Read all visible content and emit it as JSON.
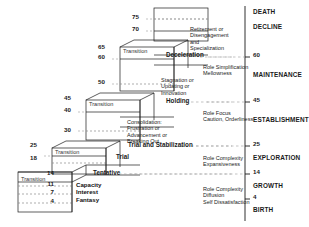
{
  "figure": {
    "ink_color": "#1a1a1a",
    "background_color": "#ffffff"
  },
  "left_ages": [
    {
      "value": "75",
      "x": 139,
      "y": 17
    },
    {
      "value": "70",
      "x": 139,
      "y": 29
    },
    {
      "value": "65",
      "x": 105,
      "y": 47
    },
    {
      "value": "60",
      "x": 105,
      "y": 57
    },
    {
      "value": "50",
      "x": 105,
      "y": 82
    },
    {
      "value": "45",
      "x": 71,
      "y": 98
    },
    {
      "value": "40",
      "x": 71,
      "y": 110
    },
    {
      "value": "30",
      "x": 71,
      "y": 130
    },
    {
      "value": "25",
      "x": 37,
      "y": 145
    },
    {
      "value": "18",
      "x": 37,
      "y": 158
    },
    {
      "value": "14",
      "x": 54,
      "y": 173
    },
    {
      "value": "11",
      "x": 54,
      "y": 184
    },
    {
      "value": "7",
      "x": 54,
      "y": 192
    },
    {
      "value": "4",
      "x": 54,
      "y": 201
    }
  ],
  "transition_boxes": [
    {
      "label": "Transition",
      "x": 123,
      "y": 49
    },
    {
      "label": "Transition",
      "x": 89,
      "y": 102
    },
    {
      "label": "Transition",
      "x": 55,
      "y": 150
    },
    {
      "label": "Transition",
      "x": 21,
      "y": 177
    }
  ],
  "phase_labels": [
    {
      "label": "Deceleration",
      "x": 166,
      "y": 55
    },
    {
      "label": "Holding",
      "x": 166,
      "y": 101
    },
    {
      "label": "Trial and Stabilization",
      "x": 128,
      "y": 145
    },
    {
      "label": "Tentative",
      "x": 93,
      "y": 173
    },
    {
      "label": "Trial",
      "x": 116,
      "y": 157
    }
  ],
  "descriptions": [
    {
      "lines": [
        "Retirement or",
        "Disengagement",
        "and",
        "Specialization"
      ],
      "x": 190,
      "y": 26,
      "bold": false
    },
    {
      "lines": [
        "Role Simplification",
        "Mellowness"
      ],
      "x": 203,
      "y": 64,
      "bold": false
    },
    {
      "lines": [
        "Stagnation or",
        "Updating or",
        "Innovation"
      ],
      "x": 161,
      "y": 77,
      "bold": false
    },
    {
      "lines": [
        "Role Focus",
        "Caution, Orderliness"
      ],
      "x": 203,
      "y": 110,
      "bold": false
    },
    {
      "lines": [
        "Consolidation:",
        "Frustration or",
        "Advancement or",
        "Breaking Out"
      ],
      "x": 127,
      "y": 119,
      "bold": false
    },
    {
      "lines": [
        "Role Complexity",
        "Expansiveness"
      ],
      "x": 203,
      "y": 155,
      "bold": false
    },
    {
      "lines": [
        "Capacity",
        "Interest",
        "Fantasy"
      ],
      "x": 76,
      "y": 181,
      "bold": true
    },
    {
      "lines": [
        "Role Complexity",
        "Diffusion",
        "Self Dissatisfaction"
      ],
      "x": 203,
      "y": 186,
      "bold": false
    }
  ],
  "right_axis": {
    "x": 253,
    "stages": [
      {
        "label": "DEATH",
        "y": 12
      },
      {
        "label": "DECLINE",
        "y": 27
      },
      {
        "label": "MAINTENANCE",
        "y": 75
      },
      {
        "label": "ESTABLISHMENT",
        "y": 120
      },
      {
        "label": "EXPLORATION",
        "y": 158
      },
      {
        "label": "GROWTH",
        "y": 186
      },
      {
        "label": "BIRTH",
        "y": 210
      }
    ],
    "ticks": [
      {
        "label": "60",
        "y": 55
      },
      {
        "label": "45",
        "y": 100
      },
      {
        "label": "25",
        "y": 144
      },
      {
        "label": "14",
        "y": 172
      },
      {
        "label": "4",
        "y": 197
      }
    ]
  },
  "chart_data": {
    "type": "diagram",
    "ylabel": "Age",
    "stages": [
      {
        "name": "GROWTH",
        "age_start": 0,
        "age_end": 14,
        "substages": [
          "Fantasy",
          "Interest",
          "Capacity"
        ],
        "ages": [
          4,
          7,
          11,
          14
        ],
        "outcomes": [
          "Role Complexity",
          "Diffusion",
          "Self Dissatisfaction"
        ]
      },
      {
        "name": "EXPLORATION",
        "age_start": 14,
        "age_end": 25,
        "substages": [
          "Tentative",
          "Transition",
          "Trial"
        ],
        "ages": [
          14,
          18,
          25
        ],
        "outcomes": [
          "Role Complexity",
          "Expansiveness"
        ]
      },
      {
        "name": "ESTABLISHMENT",
        "age_start": 25,
        "age_end": 45,
        "substages": [
          "Trial and Stabilization",
          "Consolidation: Frustration or Advancement or Breaking Out",
          "Transition"
        ],
        "ages": [
          25,
          30,
          40,
          45
        ],
        "outcomes": [
          "Role Focus",
          "Caution, Orderliness"
        ]
      },
      {
        "name": "MAINTENANCE",
        "age_start": 45,
        "age_end": 60,
        "substages": [
          "Holding",
          "Stagnation or Updating or Innovation",
          "Transition"
        ],
        "ages": [
          45,
          50,
          60,
          65
        ],
        "outcomes": [
          "Role Simplification",
          "Mellowness"
        ]
      },
      {
        "name": "DECLINE",
        "age_start": 60,
        "age_end": 75,
        "substages": [
          "Deceleration",
          "Retirement or Disengagement and Specialization"
        ],
        "ages": [
          60,
          65,
          70,
          75
        ],
        "outcomes": [
          "Retirement or Disengagement and Specialization"
        ]
      },
      {
        "name": "DEATH",
        "age_start": 75,
        "age_end": 75,
        "substages": [],
        "ages": [
          75
        ],
        "outcomes": []
      }
    ],
    "axis_ticks": [
      4,
      14,
      25,
      45,
      60
    ]
  }
}
